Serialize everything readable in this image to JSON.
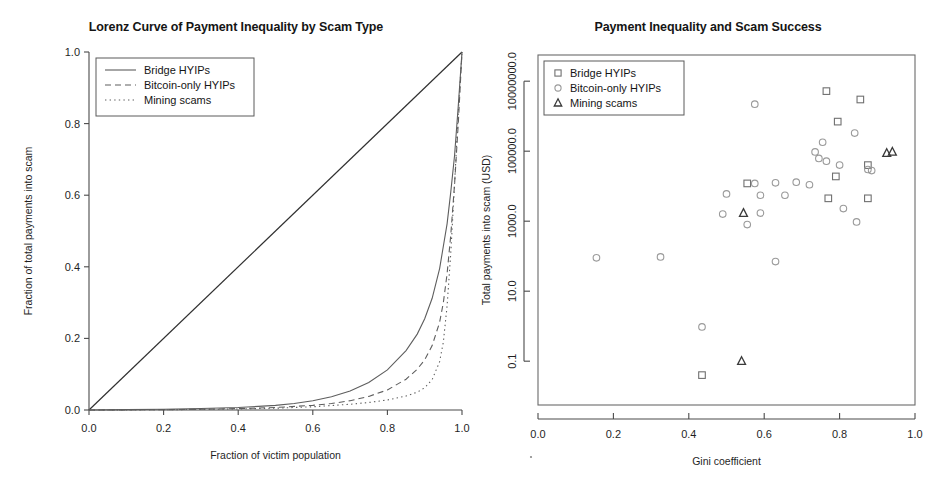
{
  "figure": {
    "width": 944,
    "height": 494,
    "background": "#ffffff"
  },
  "panels": [
    {
      "id": "lorenz",
      "title": "Lorenz Curve of Payment Inequality by Scam Type"
    },
    {
      "id": "scatter",
      "title": "Payment Inequality and Scam Success"
    }
  ],
  "chart_data": [
    {
      "type": "line",
      "id": "lorenz",
      "title": "Lorenz Curve of Payment Inequality by Scam Type",
      "xlabel": "Fraction of victim population",
      "ylabel": "Fraction of total payments into scam",
      "xlim": [
        0.0,
        1.0
      ],
      "ylim": [
        0.0,
        1.0
      ],
      "xticks": [
        "0.0",
        "0.2",
        "0.4",
        "0.6",
        "0.8",
        "1.0"
      ],
      "xtick_values": [
        0.0,
        0.2,
        0.4,
        0.6,
        0.8,
        1.0
      ],
      "yticks": [
        "0.0",
        "0.2",
        "0.4",
        "0.6",
        "0.8",
        "1.0"
      ],
      "ytick_values": [
        0.0,
        0.2,
        0.4,
        0.6,
        0.8,
        1.0
      ],
      "grid": false,
      "legend_position": "top-left",
      "series": [
        {
          "name": "Line of equality",
          "style": "solid",
          "color": "#303030",
          "in_legend": false,
          "x": [
            0.0,
            1.0
          ],
          "y": [
            0.0,
            1.0
          ]
        },
        {
          "name": "Bridge HYIPs",
          "style": "solid",
          "color": "#5e5e5e",
          "in_legend": true,
          "x": [
            0.0,
            0.1,
            0.2,
            0.3,
            0.4,
            0.5,
            0.55,
            0.6,
            0.65,
            0.7,
            0.75,
            0.8,
            0.85,
            0.88,
            0.9,
            0.92,
            0.94,
            0.96,
            0.97,
            0.98,
            0.99,
            1.0
          ],
          "y": [
            0.0,
            0.001,
            0.002,
            0.004,
            0.007,
            0.013,
            0.018,
            0.026,
            0.037,
            0.053,
            0.077,
            0.112,
            0.166,
            0.212,
            0.255,
            0.312,
            0.395,
            0.52,
            0.61,
            0.71,
            0.85,
            1.0
          ]
        },
        {
          "name": "Bitcoin-only HYIPs",
          "style": "dashed",
          "color": "#6e6e6e",
          "in_legend": true,
          "x": [
            0.0,
            0.1,
            0.2,
            0.3,
            0.4,
            0.5,
            0.6,
            0.65,
            0.7,
            0.75,
            0.8,
            0.85,
            0.88,
            0.9,
            0.92,
            0.94,
            0.95,
            0.96,
            0.97,
            0.98,
            0.99,
            1.0
          ],
          "y": [
            0.0,
            0.0005,
            0.001,
            0.002,
            0.004,
            0.007,
            0.013,
            0.018,
            0.026,
            0.038,
            0.056,
            0.086,
            0.114,
            0.14,
            0.18,
            0.245,
            0.3,
            0.38,
            0.49,
            0.63,
            0.8,
            1.0
          ]
        },
        {
          "name": "Mining scams",
          "style": "dotted",
          "color": "#6e6e6e",
          "in_legend": true,
          "x": [
            0.0,
            0.1,
            0.2,
            0.3,
            0.4,
            0.5,
            0.6,
            0.7,
            0.75,
            0.8,
            0.85,
            0.88,
            0.9,
            0.92,
            0.94,
            0.95,
            0.96,
            0.97,
            0.98,
            0.99,
            1.0
          ],
          "y": [
            0.0,
            0.0003,
            0.0008,
            0.0015,
            0.003,
            0.005,
            0.009,
            0.016,
            0.021,
            0.028,
            0.039,
            0.05,
            0.062,
            0.085,
            0.135,
            0.19,
            0.29,
            0.44,
            0.63,
            0.83,
            1.0
          ]
        }
      ],
      "legend": [
        {
          "label": "Bridge HYIPs",
          "style": "solid"
        },
        {
          "label": "Bitcoin-only HYIPs",
          "style": "dashed"
        },
        {
          "label": "Mining scams",
          "style": "dotted"
        }
      ]
    },
    {
      "type": "scatter",
      "id": "scatter",
      "title": "Payment Inequality and Scam Success",
      "xlabel": "Gini coefficient",
      "ylabel": "Total payments into scam (USD)",
      "xlim": [
        0.0,
        1.0
      ],
      "ylim": [
        0.0056,
        56000000
      ],
      "yscale": "log",
      "xticks": [
        "0.0",
        "0.2",
        "0.4",
        "0.6",
        "0.8",
        "1.0"
      ],
      "xtick_values": [
        0.0,
        0.2,
        0.4,
        0.6,
        0.8,
        1.0
      ],
      "yticks": [
        "0.1",
        "10.0",
        "1000.0",
        "100000.0",
        "10000000.0"
      ],
      "ytick_values": [
        0.1,
        10.0,
        1000.0,
        100000.0,
        10000000.0
      ],
      "grid": false,
      "legend_position": "top-left",
      "legend": [
        {
          "label": "Bridge HYIPs",
          "marker": "square"
        },
        {
          "label": "Bitcoin-only HYIPs",
          "marker": "circle"
        },
        {
          "label": "Mining scams",
          "marker": "triangle"
        }
      ],
      "series": [
        {
          "name": "Bridge HYIPs",
          "marker": "square",
          "color": "#707070",
          "points": [
            {
              "x": 0.765,
              "y": 5200000
            },
            {
              "x": 0.855,
              "y": 3000000
            },
            {
              "x": 0.795,
              "y": 700000
            },
            {
              "x": 0.555,
              "y": 12000
            },
            {
              "x": 0.875,
              "y": 40000
            },
            {
              "x": 0.79,
              "y": 19000
            },
            {
              "x": 0.77,
              "y": 4500
            },
            {
              "x": 0.875,
              "y": 4500
            },
            {
              "x": 0.435,
              "y": 0.04
            }
          ]
        },
        {
          "name": "Bitcoin-only HYIPs",
          "marker": "circle",
          "color": "#9a9a9a",
          "points": [
            {
              "x": 0.575,
              "y": 2200000
            },
            {
              "x": 0.84,
              "y": 330000
            },
            {
              "x": 0.755,
              "y": 180000
            },
            {
              "x": 0.735,
              "y": 95000
            },
            {
              "x": 0.745,
              "y": 62000
            },
            {
              "x": 0.765,
              "y": 52000
            },
            {
              "x": 0.8,
              "y": 40000
            },
            {
              "x": 0.875,
              "y": 30000
            },
            {
              "x": 0.885,
              "y": 28000
            },
            {
              "x": 0.575,
              "y": 12000
            },
            {
              "x": 0.63,
              "y": 12500
            },
            {
              "x": 0.685,
              "y": 13000
            },
            {
              "x": 0.72,
              "y": 11000
            },
            {
              "x": 0.5,
              "y": 6000
            },
            {
              "x": 0.59,
              "y": 5500
            },
            {
              "x": 0.655,
              "y": 5500
            },
            {
              "x": 0.81,
              "y": 2300
            },
            {
              "x": 0.49,
              "y": 1600
            },
            {
              "x": 0.59,
              "y": 1700
            },
            {
              "x": 0.555,
              "y": 800
            },
            {
              "x": 0.845,
              "y": 950
            },
            {
              "x": 0.155,
              "y": 90
            },
            {
              "x": 0.325,
              "y": 95
            },
            {
              "x": 0.63,
              "y": 70
            },
            {
              "x": 0.435,
              "y": 0.95
            }
          ]
        },
        {
          "name": "Mining scams",
          "marker": "triangle",
          "color": "#3a3a3a",
          "points": [
            {
              "x": 0.94,
              "y": 95000
            },
            {
              "x": 0.925,
              "y": 88000
            },
            {
              "x": 0.545,
              "y": 1700
            },
            {
              "x": 0.54,
              "y": 0.1
            }
          ]
        }
      ]
    }
  ]
}
